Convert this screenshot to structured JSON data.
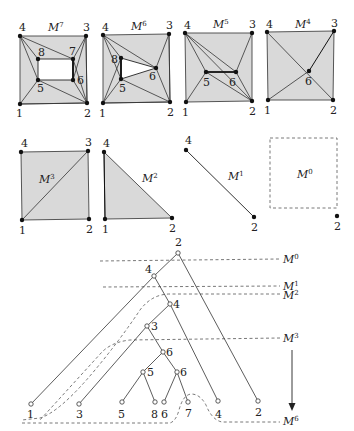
{
  "figure": {
    "meshes": [
      {
        "id": "M7",
        "label": "M",
        "sup": "7",
        "vertices": [
          "1",
          "2",
          "3",
          "4",
          "5",
          "6",
          "7",
          "8"
        ]
      },
      {
        "id": "M6",
        "label": "M",
        "sup": "6",
        "vertices": [
          "1",
          "2",
          "3",
          "4",
          "5",
          "6",
          "8"
        ]
      },
      {
        "id": "M5",
        "label": "M",
        "sup": "5",
        "vertices": [
          "1",
          "2",
          "3",
          "4",
          "5",
          "6"
        ]
      },
      {
        "id": "M4",
        "label": "M",
        "sup": "4",
        "vertices": [
          "1",
          "2",
          "3",
          "4",
          "6"
        ]
      },
      {
        "id": "M3",
        "label": "M",
        "sup": "3",
        "vertices": [
          "1",
          "2",
          "3",
          "4"
        ]
      },
      {
        "id": "M2",
        "label": "M",
        "sup": "2",
        "vertices": [
          "1",
          "2",
          "4"
        ]
      },
      {
        "id": "M1",
        "label": "M",
        "sup": "1",
        "vertices": [
          "2",
          "4"
        ]
      },
      {
        "id": "M0",
        "label": "M",
        "sup": "0",
        "vertices": [
          "2"
        ]
      }
    ],
    "labels": {
      "m7": {
        "v1": "1",
        "v2": "2",
        "v3": "3",
        "v4": "4",
        "v5": "5",
        "v6": "6",
        "v7": "7",
        "v8": "8"
      },
      "m6": {
        "v1": "1",
        "v2": "2",
        "v3": "3",
        "v4": "4",
        "v5": "5",
        "v6": "6",
        "v8": "8"
      },
      "m5": {
        "v1": "1",
        "v2": "2",
        "v3": "3",
        "v4": "4",
        "v5": "5",
        "v6": "6"
      },
      "m4": {
        "v1": "1",
        "v2": "2",
        "v3": "3",
        "v4": "4",
        "v6": "6"
      },
      "m3": {
        "v1": "1",
        "v2": "2",
        "v3": "3",
        "v4": "4"
      },
      "m2": {
        "v1": "1",
        "v2": "2",
        "v4": "4"
      },
      "m1": {
        "v2": "2",
        "v4": "4"
      },
      "m0": {
        "v2": "2"
      }
    },
    "mesh_titles": {
      "M": "M",
      "s7": "7",
      "s6": "6",
      "s5": "5",
      "s4": "4",
      "s3": "3",
      "s2": "2",
      "s1": "1",
      "s0": "0"
    },
    "tree": {
      "root": "2",
      "nodes": [
        {
          "id": "n2root",
          "label": "2"
        },
        {
          "id": "n4a",
          "label": "4"
        },
        {
          "id": "n4b",
          "label": "4"
        },
        {
          "id": "n3a",
          "label": "3"
        },
        {
          "id": "n6a",
          "label": "6"
        },
        {
          "id": "n5a",
          "label": "5"
        },
        {
          "id": "n6b",
          "label": "6"
        },
        {
          "id": "leaf1",
          "label": "1"
        },
        {
          "id": "leaf3",
          "label": "3"
        },
        {
          "id": "leaf5",
          "label": "5"
        },
        {
          "id": "leaf8",
          "label": "8"
        },
        {
          "id": "leaf6",
          "label": "6"
        },
        {
          "id": "leaf7",
          "label": "7"
        },
        {
          "id": "leaf4",
          "label": "4"
        },
        {
          "id": "leaf2",
          "label": "2"
        }
      ],
      "levels": [
        "M0",
        "M1",
        "M2",
        "M3",
        "M6"
      ],
      "tlabels": {
        "root": "2",
        "n4a": "4",
        "n4b": "4",
        "n3a": "3",
        "n6a": "6",
        "n5a": "5",
        "n6b": "6",
        "l1": "1",
        "l3": "3",
        "l5": "5",
        "l8": "8",
        "l6": "6",
        "l7": "7",
        "l4": "4",
        "l2": "2"
      }
    }
  }
}
